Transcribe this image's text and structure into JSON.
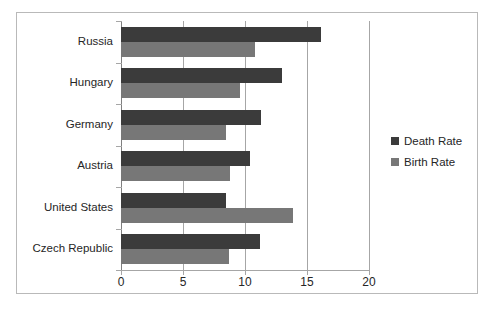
{
  "chart_data": {
    "type": "bar",
    "orientation": "horizontal",
    "title": "",
    "subtitle": "",
    "xlabel": "",
    "ylabel": "",
    "categories": [
      "Czech Republic",
      "United States",
      "Austria",
      "Germany",
      "Hungary",
      "Russia"
    ],
    "series": [
      {
        "name": "Death Rate",
        "color": "#3b3b3b",
        "values": [
          11.2,
          8.5,
          10.4,
          11.3,
          13.0,
          16.1
        ]
      },
      {
        "name": "Birth Rate",
        "color": "#777777",
        "values": [
          8.7,
          13.9,
          8.8,
          8.5,
          9.6,
          10.8
        ]
      }
    ],
    "xlim": [
      0,
      20
    ],
    "xticks": [
      0,
      5,
      10,
      15,
      20
    ],
    "xtick_labels": [
      "0",
      "5",
      "10",
      "15",
      "20"
    ],
    "grid": "vertical",
    "legend_position": "right",
    "legend": [
      "Death Rate",
      "Birth Rate"
    ]
  },
  "colors": {
    "death_rate": "#3b3b3b",
    "birth_rate": "#777777",
    "gridline": "#a6a6a6",
    "border": "#b9b9b9",
    "text": "#262626"
  }
}
